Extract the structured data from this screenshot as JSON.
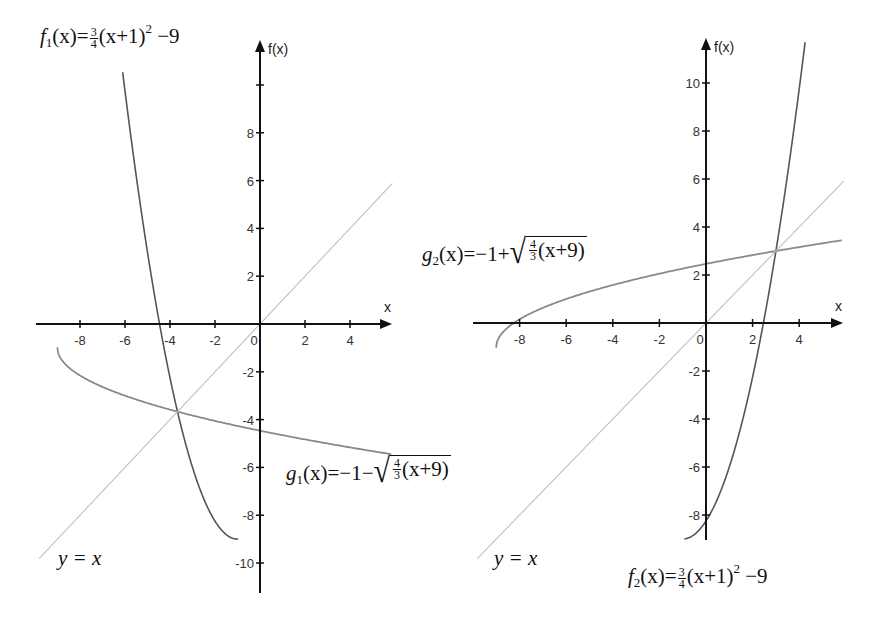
{
  "chart_data": [
    {
      "type": "line",
      "panel": "left",
      "xlabel": "x",
      "ylabel": "f(x)",
      "x_ticks": [
        -8,
        -6,
        -4,
        -2,
        0,
        2,
        4
      ],
      "y_ticks": [
        -10,
        -8,
        -6,
        -4,
        -2,
        2,
        4,
        6,
        8
      ],
      "y_tick_unlabeled": [
        10
      ],
      "xlim": [
        -9.8,
        5.9
      ],
      "ylim": [
        -11.4,
        11.7
      ],
      "series": [
        {
          "name": "f1(x) = 3/4 (x+1)^2 - 9",
          "expr": "f",
          "domain": [
            -6.1,
            -1
          ],
          "color": "#555555",
          "width": 1.6
        },
        {
          "name": "g1(x) = -1 - sqrt(4/3 (x+9))",
          "expr": "g1",
          "domain": [
            -9,
            5.8
          ],
          "color": "#8a8a8a",
          "width": 1.8
        },
        {
          "name": "y = x",
          "expr": "id",
          "domain": [
            -9.8,
            5.87
          ],
          "color": "#c0c0c0",
          "width": 1.1
        }
      ],
      "intersection": {
        "x": -3.6,
        "y": -3.6
      }
    },
    {
      "type": "line",
      "panel": "right",
      "xlabel": "x",
      "ylabel": "f(x)",
      "x_ticks": [
        -8,
        -6,
        -4,
        -2,
        0,
        2,
        4
      ],
      "y_ticks": [
        -8,
        -6,
        -4,
        -2,
        2,
        4,
        6,
        8,
        10
      ],
      "xlim": [
        -9.7,
        5.9
      ],
      "ylim": [
        -9.1,
        11.9
      ],
      "series": [
        {
          "name": "f2(x) = 3/4 (x+1)^2 - 9",
          "expr": "f",
          "domain": [
            -0.9,
            4.25
          ],
          "color": "#555555",
          "width": 1.6
        },
        {
          "name": "g2(x) = -1 + sqrt(4/3 (x+9))",
          "expr": "g2",
          "domain": [
            -9,
            5.8
          ],
          "color": "#8a8a8a",
          "width": 1.8
        },
        {
          "name": "y = x",
          "expr": "id",
          "domain": [
            -9.8,
            5.9
          ],
          "color": "#c0c0c0",
          "width": 1.1
        }
      ],
      "intersection": {
        "x": 3,
        "y": 3
      }
    }
  ],
  "panels": {
    "left": {
      "ox": 260,
      "oy": 324,
      "sx": 22.5,
      "sy": 23.9,
      "xaxis": [
        36,
        392
      ],
      "yaxis": [
        40,
        593
      ]
    },
    "right": {
      "ox": 706,
      "oy": 323,
      "sx": 23.3,
      "sy": 24.0,
      "xaxis": [
        473,
        843
      ],
      "yaxis": [
        38,
        540
      ]
    }
  },
  "labels": {
    "fx": "f(x)",
    "x": "x",
    "yx_left": "y = x",
    "yx_right": "y = x"
  },
  "formulas": {
    "f1": {
      "name": "f",
      "sub": "1",
      "arg": "(x)",
      "eq": "=",
      "frac_num": "3",
      "frac_den": "4",
      "body": "(x+1)",
      "sup": "2",
      "tail": "−9"
    },
    "g1": {
      "name": "g",
      "sub": "1",
      "arg": "(x)",
      "eq": "=",
      "lead": "−1−",
      "frac_num": "4",
      "frac_den": "3",
      "body": "(x+9)"
    },
    "g2": {
      "name": "g",
      "sub": "2",
      "arg": "(x)",
      "eq": "=",
      "lead": "−1+",
      "frac_num": "4",
      "frac_den": "3",
      "body": "(x+9)"
    },
    "f2": {
      "name": "f",
      "sub": "2",
      "arg": "(x)",
      "eq": "=",
      "frac_num": "3",
      "frac_den": "4",
      "body": "(x+1)",
      "sup": "2",
      "tail": "−9"
    }
  }
}
